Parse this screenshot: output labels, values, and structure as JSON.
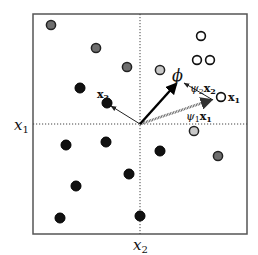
{
  "diagram": {
    "frame": {
      "x": 33,
      "y": 14,
      "width": 214,
      "height": 220
    },
    "axes": {
      "x1_label": "x",
      "x1_sub": "1",
      "x2_label": "x",
      "x2_sub": "2",
      "h_line_y": 124,
      "v_line_x": 140
    },
    "origin": {
      "x": 140,
      "y": 124
    },
    "colors": {
      "black": "#111111",
      "dark_grey": "#6e6e6e",
      "light_grey": "#c8c8c8",
      "white": "#ffffff",
      "frame": "#555555"
    },
    "points": [
      {
        "x": 51,
        "y": 25,
        "kind": "grey"
      },
      {
        "x": 96,
        "y": 48,
        "kind": "grey"
      },
      {
        "x": 127,
        "y": 67,
        "kind": "grey"
      },
      {
        "x": 80,
        "y": 88,
        "kind": "black"
      },
      {
        "x": 107,
        "y": 103,
        "kind": "black",
        "label": "x2"
      },
      {
        "x": 201,
        "y": 36,
        "kind": "open"
      },
      {
        "x": 197,
        "y": 60,
        "kind": "open"
      },
      {
        "x": 210,
        "y": 60,
        "kind": "open"
      },
      {
        "x": 160,
        "y": 70,
        "kind": "light"
      },
      {
        "x": 221,
        "y": 97,
        "kind": "open",
        "label": "x1"
      },
      {
        "x": 194,
        "y": 131,
        "kind": "light"
      },
      {
        "x": 218,
        "y": 156,
        "kind": "grey"
      },
      {
        "x": 66,
        "y": 145,
        "kind": "black"
      },
      {
        "x": 106,
        "y": 142,
        "kind": "black"
      },
      {
        "x": 160,
        "y": 151,
        "kind": "black"
      },
      {
        "x": 129,
        "y": 174,
        "kind": "black"
      },
      {
        "x": 76,
        "y": 186,
        "kind": "black"
      },
      {
        "x": 60,
        "y": 218,
        "kind": "black"
      },
      {
        "x": 140,
        "y": 216,
        "kind": "black"
      }
    ],
    "labels": {
      "phi": "ϕ",
      "x1_vec": "x",
      "x1_vec_sub": "1",
      "x2_vec": "x",
      "x2_vec_sub": "2",
      "psi1": "ψ",
      "psi1_sub": "1",
      "psi1_x": "x",
      "psi1_x_sub": "1",
      "psi2": "ψ",
      "psi2_sub": "2",
      "psi2_x": "x",
      "psi2_x_sub": "2"
    }
  }
}
